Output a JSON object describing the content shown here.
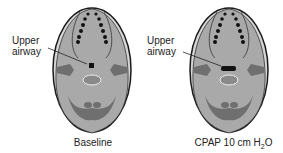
{
  "panels": [
    {
      "id": "baseline",
      "annotation": [
        "Upper",
        "airway"
      ],
      "caption": "Baseline",
      "airway_shape": "small-square"
    },
    {
      "id": "cpap",
      "annotation": [
        "Upper",
        "airway"
      ],
      "caption_prefix": "CPAP 10 cm H",
      "caption_sub": "2",
      "caption_suffix": "O",
      "airway_shape": "wide-oval"
    }
  ],
  "colors": {
    "skull_fill": "#a9a9a9",
    "outer_light": "#d6d6d6",
    "dark_region": "#6f6f6f",
    "dots": "#111111",
    "outline": "#1a1a1a"
  }
}
